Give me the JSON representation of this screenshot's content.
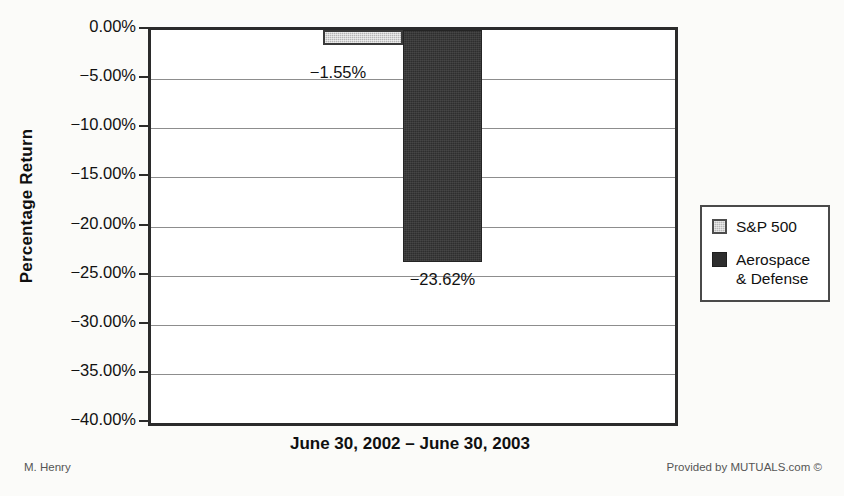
{
  "chart_data": {
    "type": "bar",
    "title": "",
    "subtitle": "",
    "xlabel": "June 30, 2002 – June 30, 2003",
    "ylabel": "Percentage Return",
    "categories": [
      "June 30, 2002 – June 30, 2003"
    ],
    "series": [
      {
        "name": "S&P 500",
        "values": [
          -1.55
        ],
        "labels": [
          "−1.55%"
        ],
        "color": "#b4b4b4"
      },
      {
        "name": "Aerospace & Defense",
        "values": [
          -23.62
        ],
        "labels": [
          "−23.62%"
        ],
        "color": "#2e2e2e"
      }
    ],
    "ylim": [
      -40,
      0
    ],
    "ytick_step": 5,
    "ytick_labels": [
      "0.00%",
      "−5.00%",
      "−10.00%",
      "−15.00%",
      "−20.00%",
      "−25.00%",
      "−30.00%",
      "−35.00%",
      "−40.00%"
    ],
    "ytick_values": [
      0,
      -5,
      -10,
      -15,
      -20,
      -25,
      -30,
      -35,
      -40
    ],
    "grid": true,
    "grid_axis": "y",
    "legend_position": "right",
    "legend_entries": [
      "S&P 500",
      "Aerospace & Defense"
    ]
  },
  "axes": {
    "y_title": "Percentage Return",
    "x_title": "June 30, 2002 – June 30, 2003"
  },
  "legend": {
    "items": [
      {
        "label": "S&P 500",
        "swatch": "legend-swatch-sp500"
      },
      {
        "label_line1": "Aerospace",
        "label_line2": "& Defense",
        "swatch": "legend-swatch-aerospace"
      }
    ]
  },
  "labels": {
    "sp500_value": "−1.55%",
    "aerospace_value": "−23.62%"
  },
  "footer": {
    "left": "M. Henry",
    "right": "Provided by MUTUALS.com ©"
  },
  "colors": {
    "sp500": "#b4b4b4",
    "aerospace": "#2e2e2e",
    "axis": "#2b2b2b",
    "grid": "#8d8d8d",
    "background": "#fbfbf9"
  }
}
